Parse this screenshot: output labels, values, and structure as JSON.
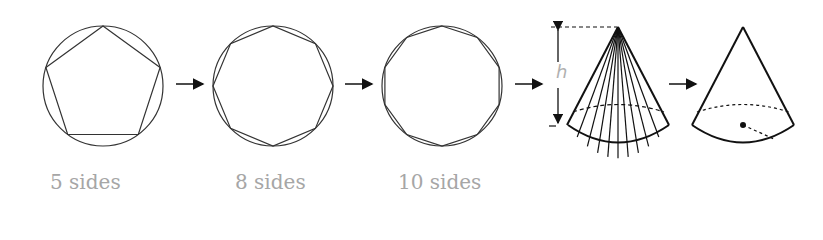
{
  "diagram": {
    "stages": [
      {
        "id": "pentagon",
        "label": "5 sides",
        "sides": 5
      },
      {
        "id": "octagon",
        "label": "8 sides",
        "sides": 8
      },
      {
        "id": "decagon",
        "label": "10 sides",
        "sides": 10
      },
      {
        "id": "pyramid-cone",
        "label": "",
        "note": "many-sided pyramid approximating a cone"
      },
      {
        "id": "cone",
        "label": "",
        "note": "cone with radius"
      }
    ],
    "height_label": "h",
    "colors": {
      "stroke": "#222222",
      "label": "#a6a6a6"
    }
  }
}
